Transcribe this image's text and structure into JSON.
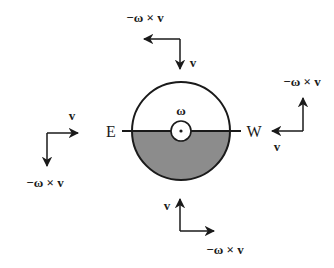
{
  "diagram": {
    "colors": {
      "stroke": "#1a1a1a",
      "fill_lower_half": "#8c8c8c",
      "background": "#ffffff"
    },
    "disk": {
      "center": [
        181,
        131
      ],
      "radius": 49,
      "hub_radius": 10,
      "rotation_label": "ω",
      "west_label": "W",
      "east_label": "E"
    },
    "vector_groups": [
      {
        "position": "top",
        "v_label": "v",
        "coriolis_label": "−ω × v",
        "v_direction": "down",
        "coriolis_direction": "left"
      },
      {
        "position": "right",
        "v_label": "v",
        "coriolis_label": "−ω × v",
        "v_direction": "left",
        "coriolis_direction": "up"
      },
      {
        "position": "left",
        "v_label": "v",
        "coriolis_label": "−ω × v",
        "v_direction": "right",
        "coriolis_direction": "down"
      },
      {
        "position": "bottom",
        "v_label": "v",
        "coriolis_label": "−ω × v",
        "v_direction": "up",
        "coriolis_direction": "right"
      }
    ]
  }
}
